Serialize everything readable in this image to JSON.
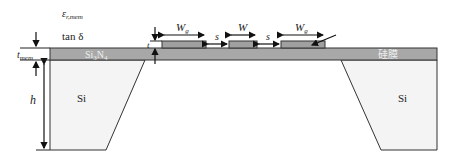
{
  "diagram": {
    "labels": {
      "epsilon": "ε",
      "epsilon_sub": "r,mem",
      "tan_delta": "tan δ",
      "t_mem": "t",
      "t_mem_sub": "mem",
      "h": "h",
      "t": "t",
      "membrane_material": "Si",
      "membrane_material_sub1": "3",
      "membrane_material_mid": "N",
      "membrane_material_sub2": "4",
      "membrane_label_right": "硅膜",
      "substrate_left": "Si",
      "substrate_right": "Si",
      "ground_width_left": "W",
      "ground_width_left_sub": "g",
      "signal_width": "W",
      "gap_left": "s",
      "gap_right": "s",
      "ground_width_right": "W",
      "ground_width_right_sub": "g"
    },
    "colors": {
      "membrane": "#a8a8a8",
      "conductor": "#a0a0a0",
      "substrate": "#f4f4f4",
      "line": "#222222"
    }
  }
}
